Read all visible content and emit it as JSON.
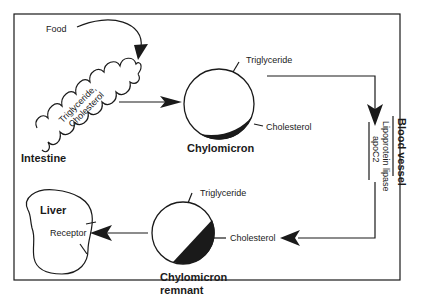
{
  "diagram": {
    "labels": {
      "food": "Food",
      "intestine_contents_line1": "Triglyceride,",
      "intestine_contents_line2": "Cholesterol",
      "intestine": "Intestine",
      "chylomicron": "Chylomicron",
      "chylomicron_triglyceride": "Triglyceride",
      "chylomicron_cholesterol": "Cholesterol",
      "blood_vessel": "Blood vessel",
      "lipoprotein_lipase": "Lipoprotein lipase",
      "apoc2": "apoC2",
      "remnant_line1": "Chylomicron",
      "remnant_line2": "remnant",
      "remnant_triglyceride": "Triglyceride",
      "released_cholesterol": "Cholesterol",
      "liver": "Liver",
      "receptor": "Receptor"
    },
    "colors": {
      "ink": "#1a1a1a",
      "background": "#ffffff"
    }
  }
}
